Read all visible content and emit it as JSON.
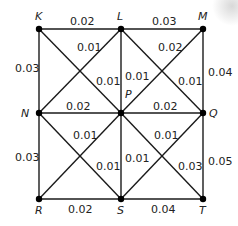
{
  "diagram": {
    "type": "weighted-grid-graph",
    "vertices": [
      {
        "id": "K",
        "label": "K",
        "x": 39,
        "y": 29,
        "lx": 35,
        "ly": 20
      },
      {
        "id": "L",
        "label": "L",
        "x": 121,
        "y": 29,
        "lx": 117,
        "ly": 20
      },
      {
        "id": "M",
        "label": "M",
        "x": 203,
        "y": 29,
        "lx": 198,
        "ly": 20
      },
      {
        "id": "N",
        "label": "N",
        "x": 39,
        "y": 113,
        "lx": 21,
        "ly": 117
      },
      {
        "id": "P",
        "label": "P",
        "x": 121,
        "y": 113,
        "lx": 125,
        "ly": 98
      },
      {
        "id": "Q",
        "label": "Q",
        "x": 203,
        "y": 113,
        "lx": 209,
        "ly": 117
      },
      {
        "id": "R",
        "label": "R",
        "x": 39,
        "y": 199,
        "lx": 35,
        "ly": 214
      },
      {
        "id": "S",
        "label": "S",
        "x": 121,
        "y": 199,
        "lx": 117,
        "ly": 214
      },
      {
        "id": "T",
        "label": "T",
        "x": 203,
        "y": 199,
        "lx": 199,
        "ly": 214
      }
    ],
    "edges": [
      {
        "from": "K",
        "to": "L",
        "weight": "0.02",
        "lx": 70,
        "ly": 25
      },
      {
        "from": "L",
        "to": "M",
        "weight": "0.03",
        "lx": 152,
        "ly": 25
      },
      {
        "from": "K",
        "to": "N",
        "weight": "0.03",
        "lx": 15,
        "ly": 72
      },
      {
        "from": "M",
        "to": "Q",
        "weight": "0.04",
        "lx": 208,
        "ly": 76
      },
      {
        "from": "L",
        "to": "P",
        "weight": "0.01",
        "lx": 125,
        "ly": 80
      },
      {
        "from": "N",
        "to": "P",
        "weight": "0.02",
        "lx": 66,
        "ly": 110
      },
      {
        "from": "P",
        "to": "Q",
        "weight": "0.02",
        "lx": 153,
        "ly": 110
      },
      {
        "from": "K",
        "to": "P",
        "weight": "0.01",
        "lx": 96,
        "ly": 85
      },
      {
        "from": "L",
        "to": "N",
        "weight": "0.01",
        "lx": 77,
        "ly": 51
      },
      {
        "from": "L",
        "to": "Q",
        "weight": "0.01",
        "lx": 178,
        "ly": 85
      },
      {
        "from": "M",
        "to": "P",
        "weight": "0.02",
        "lx": 158,
        "ly": 51
      },
      {
        "from": "N",
        "to": "R",
        "weight": "0.03",
        "lx": 15,
        "ly": 161
      },
      {
        "from": "N",
        "to": "S",
        "weight": "0.01",
        "lx": 96,
        "ly": 170
      },
      {
        "from": "P",
        "to": "R",
        "weight": "0.01",
        "lx": 73,
        "ly": 139
      },
      {
        "from": "P",
        "to": "S",
        "weight": "0.01",
        "lx": 125,
        "ly": 162
      },
      {
        "from": "P",
        "to": "T",
        "weight": "0.03",
        "lx": 178,
        "ly": 170
      },
      {
        "from": "Q",
        "to": "S",
        "weight": "0.01",
        "lx": 154,
        "ly": 139
      },
      {
        "from": "Q",
        "to": "T",
        "weight": "0.05",
        "lx": 208,
        "ly": 165
      },
      {
        "from": "R",
        "to": "S",
        "weight": "0.02",
        "lx": 68,
        "ly": 213
      },
      {
        "from": "S",
        "to": "T",
        "weight": "0.04",
        "lx": 151,
        "ly": 213
      }
    ]
  }
}
